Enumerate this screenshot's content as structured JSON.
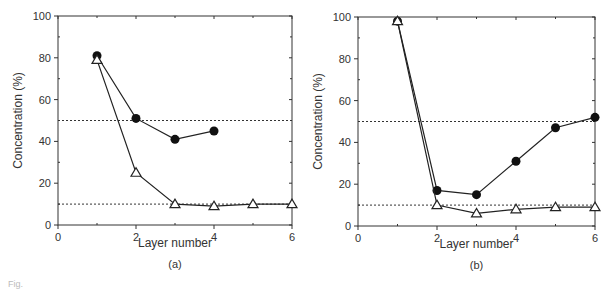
{
  "chart_data": [
    {
      "type": "line",
      "panel_label": "(a)",
      "xlabel": "Layer number",
      "ylabel": "Concentration  (%)",
      "xlim": [
        0,
        6
      ],
      "ylim": [
        0,
        100
      ],
      "xticks": [
        0,
        2,
        4,
        6
      ],
      "yticks": [
        0,
        20,
        40,
        60,
        80,
        100
      ],
      "reference_lines": [
        50,
        10
      ],
      "series": [
        {
          "name": "filled-circles",
          "marker": "circle-filled",
          "x": [
            1,
            2,
            3,
            4
          ],
          "values": [
            81,
            51,
            41,
            45
          ]
        },
        {
          "name": "open-triangles",
          "marker": "triangle-open",
          "x": [
            1,
            2,
            3,
            4,
            5,
            6
          ],
          "values": [
            79,
            25,
            10,
            9,
            10,
            10
          ]
        }
      ]
    },
    {
      "type": "line",
      "panel_label": "(b)",
      "xlabel": "Layer number",
      "ylabel": "Concentration  (%)",
      "xlim": [
        0,
        6
      ],
      "ylim": [
        0,
        100
      ],
      "xticks": [
        0,
        2,
        4,
        6
      ],
      "yticks": [
        0,
        20,
        40,
        60,
        80,
        100
      ],
      "reference_lines": [
        50,
        10
      ],
      "series": [
        {
          "name": "filled-circles",
          "marker": "circle-filled",
          "x": [
            1,
            2,
            3,
            4,
            5,
            6
          ],
          "values": [
            98,
            17,
            15,
            31,
            47,
            52
          ]
        },
        {
          "name": "open-triangles",
          "marker": "triangle-open",
          "x": [
            1,
            2,
            3,
            4,
            5,
            6
          ],
          "values": [
            98,
            10,
            6,
            8,
            9,
            9
          ]
        }
      ]
    }
  ],
  "caption": "Fig."
}
